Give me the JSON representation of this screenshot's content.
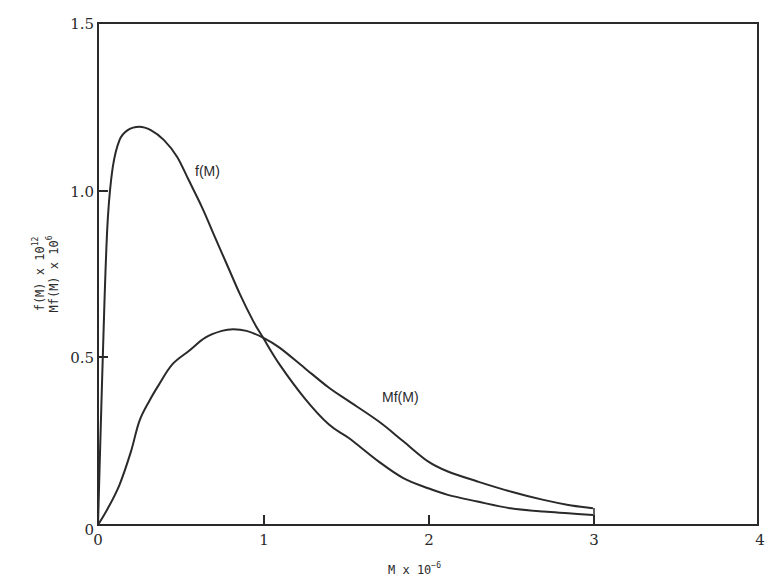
{
  "chart_data": {
    "type": "line",
    "title": "",
    "xlabel": "M x 10^-6",
    "xlabel_parts": {
      "base": "M x 10",
      "exp": "-6"
    },
    "ylabel_lines": [
      {
        "base": "f(M) x 10",
        "exp": "12"
      },
      {
        "base": "Mf(M) x 10",
        "exp": "6"
      }
    ],
    "xlim": [
      0,
      4
    ],
    "ylim": [
      0,
      1.5
    ],
    "xticks": [
      0,
      1,
      2,
      3,
      4
    ],
    "xtick_labels": [
      "0",
      "1",
      "2",
      "3",
      "4"
    ],
    "yticks": [
      0,
      0.5,
      1.0,
      1.5
    ],
    "ytick_labels": [
      "0",
      "0.5",
      "1.0",
      "1.5"
    ],
    "grid": false,
    "legend": "none (inline curve annotations)",
    "series": [
      {
        "name": "f(M)",
        "label_pos": {
          "x": 0.62,
          "y": 1.05
        },
        "x": [
          0.0,
          0.02,
          0.04,
          0.06,
          0.09,
          0.13,
          0.18,
          0.25,
          0.32,
          0.4,
          0.48,
          0.55,
          0.63,
          0.7,
          0.78,
          0.86,
          0.94,
          1.0,
          1.1,
          1.25,
          1.4,
          1.52,
          1.7,
          1.85,
          2.0,
          2.12,
          2.3,
          2.5,
          2.7,
          2.85,
          3.0
        ],
        "values": [
          0.0,
          0.35,
          0.68,
          0.92,
          1.07,
          1.15,
          1.18,
          1.19,
          1.18,
          1.15,
          1.1,
          1.03,
          0.95,
          0.87,
          0.78,
          0.69,
          0.61,
          0.56,
          0.48,
          0.38,
          0.3,
          0.26,
          0.19,
          0.14,
          0.11,
          0.09,
          0.07,
          0.05,
          0.04,
          0.035,
          0.03
        ]
      },
      {
        "name": "Mf(M)",
        "label_pos": {
          "x": 1.72,
          "y": 0.38
        },
        "x": [
          0.0,
          0.06,
          0.13,
          0.2,
          0.25,
          0.31,
          0.37,
          0.45,
          0.55,
          0.65,
          0.75,
          0.82,
          0.9,
          1.0,
          1.1,
          1.25,
          1.4,
          1.52,
          1.7,
          1.85,
          2.0,
          2.12,
          2.3,
          2.5,
          2.7,
          2.85,
          3.0
        ],
        "values": [
          0.0,
          0.05,
          0.12,
          0.22,
          0.31,
          0.37,
          0.42,
          0.48,
          0.52,
          0.56,
          0.58,
          0.585,
          0.58,
          0.56,
          0.53,
          0.47,
          0.41,
          0.37,
          0.31,
          0.25,
          0.19,
          0.16,
          0.13,
          0.1,
          0.075,
          0.06,
          0.05
        ]
      }
    ],
    "annotations": [
      "f(M)",
      "Mf(M)"
    ]
  },
  "labels": {
    "f_curve": "f(M)",
    "mf_curve": "Mf(M)",
    "x_axis_base": "M x 10",
    "x_axis_exp": "−6",
    "y_axis_line1_base": "f(M) x 10",
    "y_axis_line1_exp": "12",
    "y_axis_line2_base": "Mf(M) x 10",
    "y_axis_line2_exp": "6",
    "x_tick_0": "0",
    "x_tick_1": "1",
    "x_tick_2": "2",
    "x_tick_3": "3",
    "x_tick_4": "4",
    "y_tick_0": "0",
    "y_tick_05": "0.5",
    "y_tick_10": "1.0",
    "y_tick_15": "1.5"
  },
  "colors": {
    "line": "#2a2a2a",
    "frame": "#2a2a2a",
    "background": "#ffffff"
  }
}
